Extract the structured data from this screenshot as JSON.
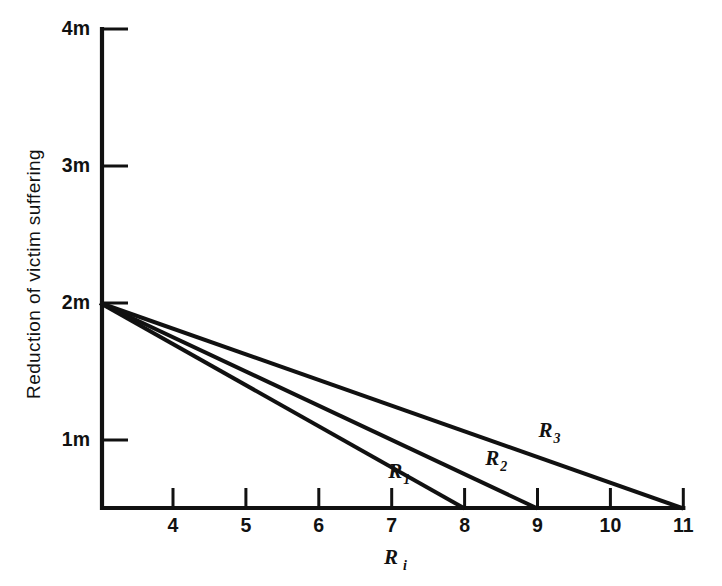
{
  "chart_data": {
    "type": "line",
    "title": "",
    "subtitle": "",
    "xlabel": "R_i",
    "xlabel_base": "R",
    "xlabel_sub": "i",
    "ylabel": "Reduction of victim suffering",
    "xlim": [
      3.0,
      11.0
    ],
    "ylim": [
      0.5,
      4.0
    ],
    "grid": false,
    "legend": "inline-annotations",
    "x_ticks": [
      {
        "value": 4,
        "label": "4"
      },
      {
        "value": 5,
        "label": "5"
      },
      {
        "value": 6,
        "label": "6"
      },
      {
        "value": 7,
        "label": "7"
      },
      {
        "value": 8,
        "label": "8"
      },
      {
        "value": 9,
        "label": "9"
      },
      {
        "value": 10,
        "label": "10"
      },
      {
        "value": 11,
        "label": "11"
      }
    ],
    "y_ticks": [
      {
        "value": 1,
        "label": "1m"
      },
      {
        "value": 2,
        "label": "2m"
      },
      {
        "value": 3,
        "label": "3m"
      },
      {
        "value": 4,
        "label": "4m"
      }
    ],
    "series": [
      {
        "name": "R_1",
        "name_base": "R",
        "name_sub": "1",
        "x": [
          3.0,
          8.0
        ],
        "y": [
          2.0,
          0.5
        ],
        "label_x": 7.05,
        "label_y": 0.72,
        "color": "#111111"
      },
      {
        "name": "R_2",
        "name_base": "R",
        "name_sub": "2",
        "x": [
          3.0,
          9.0
        ],
        "y": [
          2.0,
          0.5
        ],
        "label_x": 8.38,
        "label_y": 0.82,
        "color": "#111111"
      },
      {
        "name": "R_3",
        "name_base": "R",
        "name_sub": "3",
        "x": [
          3.0,
          11.0
        ],
        "y": [
          2.0,
          0.5
        ],
        "label_x": 9.11,
        "label_y": 1.02,
        "color": "#111111"
      }
    ]
  },
  "figure": {
    "background_color": "#ffffff",
    "axis_color": "#111111",
    "line_color": "#111111"
  }
}
